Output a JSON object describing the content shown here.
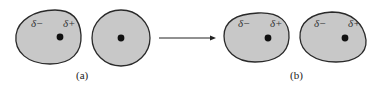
{
  "figure": {
    "panel_a": {
      "caption": "(a)",
      "left_particle": {
        "charge_neg": "δ−",
        "charge_pos": "δ+",
        "shape": "distorted-blob"
      },
      "right_particle": {
        "shape": "circle"
      }
    },
    "arrow": {
      "direction": "right"
    },
    "panel_b": {
      "caption": "(b)",
      "left_particle": {
        "charge_neg": "δ−",
        "charge_pos": "δ+",
        "shape": "distorted-blob"
      },
      "right_particle": {
        "charge_neg": "δ−",
        "charge_pos": "δ+",
        "shape": "distorted-blob"
      }
    },
    "colors": {
      "fill": "#c8c8c8",
      "outline": "#2a2a2a",
      "nucleus": "#111111"
    }
  }
}
